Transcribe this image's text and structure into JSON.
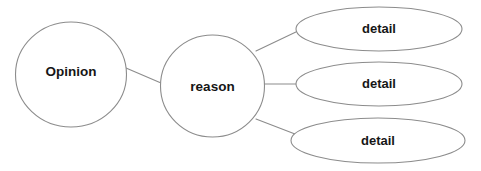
{
  "diagram": {
    "type": "concept-map",
    "background_color": "#ffffff",
    "stroke_color": "#8c8c8c",
    "text_color": "#161616",
    "nodes": {
      "root": {
        "label": "Opinion",
        "shape": "circle",
        "cx": 71,
        "cy": 74.5,
        "rx": 55.5,
        "ry": 52.5
      },
      "branch": {
        "label": "reason",
        "shape": "circle",
        "cx": 212.5,
        "cy": 86,
        "rx": 52,
        "ry": 51
      },
      "leaves": [
        {
          "label": "detail",
          "shape": "ellipse",
          "cx": 379,
          "cy": 29,
          "rx": 83,
          "ry": 22
        },
        {
          "label": "detail",
          "shape": "ellipse",
          "cx": 379,
          "cy": 84,
          "rx": 83,
          "ry": 22
        },
        {
          "label": "detail",
          "shape": "ellipse",
          "cx": 378,
          "cy": 140.5,
          "rx": 87,
          "ry": 22.5
        }
      ]
    },
    "connectors": [
      {
        "name": "root-to-branch",
        "x1": 126,
        "y1": 68,
        "x2": 161,
        "y2": 83
      },
      {
        "name": "branch-to-detail-1",
        "x1": 256,
        "y1": 51,
        "x2": 298,
        "y2": 31
      },
      {
        "name": "branch-to-detail-2",
        "x1": 264,
        "y1": 84,
        "x2": 296,
        "y2": 84
      },
      {
        "name": "branch-to-detail-3",
        "x1": 256,
        "y1": 119,
        "x2": 295,
        "y2": 134
      }
    ]
  }
}
